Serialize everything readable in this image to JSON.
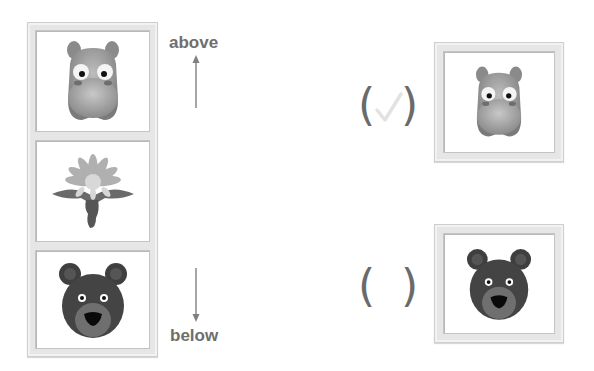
{
  "question": {
    "labels": {
      "above": "above",
      "below": "below"
    },
    "sequence": [
      {
        "animal": "hippo",
        "icon": "hippo-face-icon"
      },
      {
        "animal": "dandelion",
        "icon": "dandelion-flower-icon"
      },
      {
        "animal": "bear",
        "icon": "bear-face-icon"
      }
    ]
  },
  "choices": [
    {
      "animal": "hippo",
      "icon": "hippo-face-icon",
      "mark": "✓",
      "checked": true,
      "open_paren": "(",
      "close_paren": ")"
    },
    {
      "animal": "bear",
      "icon": "bear-face-icon",
      "mark": "",
      "checked": false,
      "open_paren": "(",
      "close_paren": ")"
    }
  ],
  "colors": {
    "label": "#6e6e6e",
    "frame": "#e6e6e6",
    "check": "#e2e2e2"
  }
}
